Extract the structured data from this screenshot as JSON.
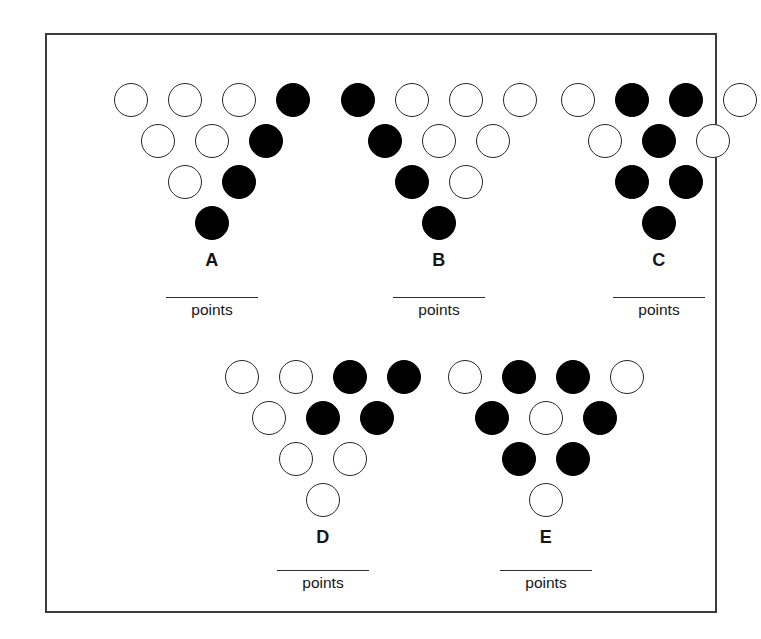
{
  "page": {
    "kind": "worksheet",
    "background_color": "#ffffff",
    "frame_color": "#3a3a40",
    "open_circle_color": "#ffffff",
    "open_circle_border_color": "#27272b",
    "filled_circle_color": "#000000",
    "points_word": "points"
  },
  "chart_data": {
    "type": "table",
    "title": "",
    "xlabel": "",
    "ylabel": "",
    "legend": [
      "open = white circle",
      "filled = black circle"
    ],
    "categories": [
      "A",
      "B",
      "C",
      "D",
      "E"
    ],
    "series": [
      {
        "name": "filled_count",
        "values": [
          4,
          4,
          6,
          4,
          5
        ]
      },
      {
        "name": "open_count",
        "values": [
          6,
          6,
          4,
          6,
          5
        ]
      },
      {
        "name": "total_count",
        "values": [
          10,
          10,
          10,
          10,
          10
        ]
      }
    ]
  },
  "figures": [
    {
      "id": "A",
      "label": "A",
      "answer_value": "",
      "points_label": "points",
      "filled_count": 4,
      "open_count": 6,
      "rows": [
        [
          "open",
          "open",
          "open",
          "filled"
        ],
        [
          "open",
          "open",
          "filled"
        ],
        [
          "open",
          "filled"
        ],
        [
          "filled"
        ]
      ]
    },
    {
      "id": "B",
      "label": "B",
      "answer_value": "",
      "points_label": "points",
      "filled_count": 4,
      "open_count": 6,
      "rows": [
        [
          "filled",
          "open",
          "open",
          "open"
        ],
        [
          "filled",
          "open",
          "open"
        ],
        [
          "filled",
          "open"
        ],
        [
          "filled"
        ]
      ]
    },
    {
      "id": "C",
      "label": "C",
      "answer_value": "",
      "points_label": "points",
      "filled_count": 6,
      "open_count": 4,
      "rows": [
        [
          "open",
          "filled",
          "filled",
          "open"
        ],
        [
          "open",
          "filled",
          "open"
        ],
        [
          "filled",
          "filled"
        ],
        [
          "filled"
        ]
      ]
    },
    {
      "id": "D",
      "label": "D",
      "answer_value": "",
      "points_label": "points",
      "filled_count": 4,
      "open_count": 6,
      "rows": [
        [
          "open",
          "open",
          "filled",
          "filled"
        ],
        [
          "open",
          "filled",
          "filled"
        ],
        [
          "open",
          "open"
        ],
        [
          "open"
        ]
      ]
    },
    {
      "id": "E",
      "label": "E",
      "answer_value": "",
      "points_label": "points",
      "filled_count": 5,
      "open_count": 5,
      "rows": [
        [
          "open",
          "filled",
          "filled",
          "open"
        ],
        [
          "filled",
          "open",
          "filled"
        ],
        [
          "filled",
          "filled"
        ],
        [
          "open"
        ]
      ]
    }
  ]
}
